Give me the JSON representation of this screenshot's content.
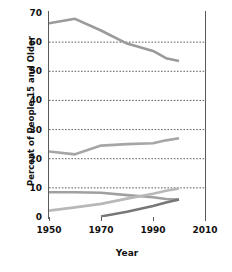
{
  "chart_data": {
    "type": "line",
    "title": "",
    "xlabel": "Year",
    "ylabel": "Percent of People 15 and Older",
    "xlim": [
      1950,
      2010
    ],
    "ylim": [
      0,
      70
    ],
    "xticks": [
      1950,
      1970,
      1990,
      2010
    ],
    "yticks": [
      0,
      10,
      20,
      30,
      40,
      50,
      60,
      70
    ],
    "grid": true,
    "legend": "none",
    "series": [
      {
        "name": "series-1",
        "color": "#9a9a9a",
        "x": [
          1950,
          1960,
          1970,
          1980,
          1990,
          1995,
          2000
        ],
        "values": [
          66.5,
          68.0,
          64.0,
          59.5,
          57.0,
          54.5,
          53.5
        ]
      },
      {
        "name": "series-2",
        "color": "#a6a6a6",
        "x": [
          1950,
          1960,
          1970,
          1980,
          1990,
          1995,
          2000
        ],
        "values": [
          22.5,
          21.5,
          24.5,
          25.0,
          25.3,
          26.3,
          27.0
        ]
      },
      {
        "name": "series-3",
        "color": "#a0a0a0",
        "x": [
          1950,
          1960,
          1970,
          1980,
          1990,
          1995,
          2000
        ],
        "values": [
          8.5,
          8.5,
          8.3,
          7.5,
          6.8,
          6.2,
          6.0
        ]
      },
      {
        "name": "series-4",
        "color": "#b8b8b8",
        "x": [
          1950,
          1960,
          1970,
          1980,
          1990,
          1995,
          2000
        ],
        "values": [
          2.2,
          3.3,
          4.5,
          6.3,
          8.0,
          9.0,
          9.8
        ]
      },
      {
        "name": "series-5",
        "color": "#777777",
        "x": [
          1970,
          1980,
          1990,
          1995,
          2000
        ],
        "values": [
          0.2,
          1.8,
          3.8,
          5.0,
          6.0
        ]
      }
    ]
  },
  "axes": {
    "y_tick_labels": [
      "70",
      "60",
      "50",
      "40",
      "30",
      "20",
      "10",
      "0"
    ],
    "x_tick_labels": [
      "1950",
      "1970",
      "1990",
      "2010"
    ],
    "y_axis_title": "Percent of People 15 and Older",
    "x_axis_title": "Year"
  },
  "colors": {
    "axis": "#5a5a5a",
    "grid": "#4d4d4d",
    "background": "#ffffff",
    "text": "#111111"
  }
}
